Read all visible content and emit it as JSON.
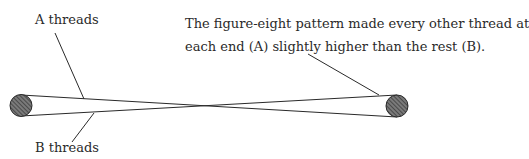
{
  "figure": {
    "labels": {
      "a_threads": "A threads",
      "b_threads": "B threads"
    },
    "caption": {
      "line1": "The figure-eight pattern made every other thread at",
      "line2": "each end (A) slightly higher than the rest (B)."
    },
    "colors": {
      "line": "#2a2a2a",
      "post_fill": "#6b6b6b",
      "post_hatch": "#2f2f2f"
    }
  }
}
